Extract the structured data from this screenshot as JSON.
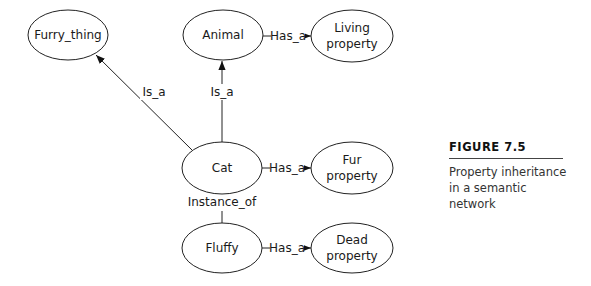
{
  "figure": {
    "label": "FIGURE 7.5",
    "caption_line1": "Property inheritance",
    "caption_line2": "in a semantic network"
  },
  "nodes": {
    "furry_thing": {
      "label": "Furry_thing"
    },
    "animal": {
      "label": "Animal"
    },
    "living_property": {
      "line1": "Living",
      "line2": "property"
    },
    "cat": {
      "label": "Cat"
    },
    "fur_property": {
      "line1": "Fur",
      "line2": "property"
    },
    "fluffy": {
      "label": "Fluffy"
    },
    "dead_property": {
      "line1": "Dead",
      "line2": "property"
    }
  },
  "edges": {
    "cat_furry": {
      "label": "Is_a"
    },
    "cat_animal": {
      "label": "Is_a"
    },
    "animal_living": {
      "label": "Has_a"
    },
    "cat_fur": {
      "label": "Has_a"
    },
    "fluffy_cat": {
      "label": "Instance_of"
    },
    "fluffy_dead": {
      "label": "Has_a"
    }
  }
}
